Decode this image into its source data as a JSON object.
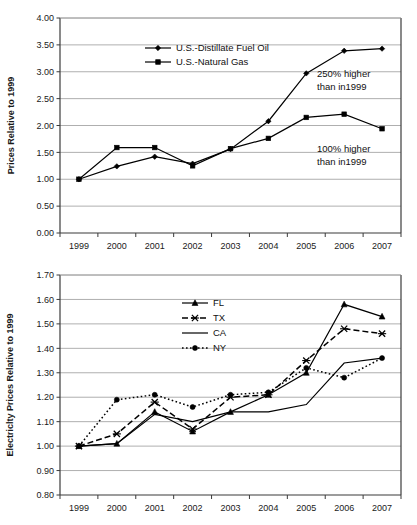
{
  "chart_data": [
    {
      "id": "fuel-prices",
      "type": "line",
      "title": "",
      "xlabel": "",
      "ylabel": "Prices Relative to 1999",
      "x": [
        "1999",
        "2000",
        "2001",
        "2002",
        "2003",
        "2004",
        "2005",
        "2006",
        "2007"
      ],
      "ylim": [
        0.0,
        4.0
      ],
      "ytick_step": 0.5,
      "ytick_labels": [
        "0.00",
        "0.50",
        "1.00",
        "1.50",
        "2.00",
        "2.50",
        "3.00",
        "3.50",
        "4.00"
      ],
      "grid": "horizontal",
      "legend_position": "inside-top-center",
      "series": [
        {
          "name": "U.S.-Distillate Fuel Oil",
          "marker": "diamond",
          "dash": "solid",
          "values": [
            1.0,
            1.24,
            1.42,
            1.29,
            1.56,
            2.08,
            2.97,
            3.39,
            3.43
          ]
        },
        {
          "name": "U.S.-Natural Gas",
          "marker": "square",
          "dash": "solid",
          "values": [
            1.0,
            1.59,
            1.59,
            1.25,
            1.57,
            1.76,
            2.15,
            2.21,
            1.94
          ]
        }
      ],
      "annotations": [
        {
          "id": "annot-250",
          "line1": "250% higher",
          "line2": "than in1999"
        },
        {
          "id": "annot-100",
          "line1": "100% higher",
          "line2": "than in1999"
        }
      ]
    },
    {
      "id": "electricity-prices",
      "type": "line",
      "title": "",
      "xlabel": "",
      "ylabel": "Electriclty Prices Relative to 1999",
      "x": [
        "1999",
        "2000",
        "2001",
        "2002",
        "2003",
        "2004",
        "2005",
        "2006",
        "2007"
      ],
      "ylim": [
        0.8,
        1.7
      ],
      "ytick_step": 0.1,
      "ytick_labels": [
        "0.80",
        "0.90",
        "1.00",
        "1.10",
        "1.20",
        "1.30",
        "1.40",
        "1.50",
        "1.60",
        "1.70"
      ],
      "grid": "horizontal",
      "legend_position": "inside-top-center",
      "series": [
        {
          "name": "FL",
          "marker": "triangle",
          "dash": "solid",
          "values": [
            1.0,
            1.01,
            1.14,
            1.06,
            1.14,
            1.21,
            1.3,
            1.58,
            1.53
          ]
        },
        {
          "name": "TX",
          "marker": "x",
          "dash": "dashed",
          "values": [
            1.0,
            1.05,
            1.18,
            1.07,
            1.2,
            1.21,
            1.35,
            1.48,
            1.46
          ]
        },
        {
          "name": "CA",
          "marker": "none",
          "dash": "solid",
          "values": [
            1.0,
            1.01,
            1.13,
            1.1,
            1.14,
            1.14,
            1.17,
            1.34,
            1.36
          ]
        },
        {
          "name": "NY",
          "marker": "circle",
          "dash": "dotted",
          "values": [
            1.0,
            1.19,
            1.21,
            1.16,
            1.21,
            1.22,
            1.32,
            1.28,
            1.36
          ]
        }
      ],
      "annotations": []
    }
  ],
  "colors": {
    "ink": "#000000",
    "grid": "#9a9a9a",
    "frame": "#3b3b3b",
    "background": "#ffffff"
  }
}
